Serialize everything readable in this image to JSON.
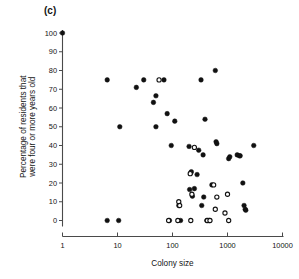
{
  "figure": {
    "panel_label": "(c)",
    "background_color": "#ffffff",
    "axis_color": "#4a4a4a",
    "marker_color": "#111111"
  },
  "chart_data": {
    "type": "scatter",
    "title": "(c)",
    "xlabel": "Colony size",
    "ylabel": "Percentage of residents that were four or more years old",
    "xscale": "log",
    "yscale": "linear",
    "xlim": [
      1,
      10000
    ],
    "ylim": [
      0,
      100
    ],
    "xticks": [
      1,
      10,
      100,
      1000,
      10000
    ],
    "xtick_labels": [
      "1",
      "10",
      "100",
      "1000",
      "10000"
    ],
    "yticks": [
      0,
      10,
      20,
      30,
      40,
      50,
      60,
      70,
      80,
      90,
      100
    ],
    "ytick_labels": [
      "0",
      "10",
      "20",
      "30",
      "40",
      "50",
      "60",
      "70",
      "80",
      "90",
      "100"
    ],
    "grid": false,
    "legend": null,
    "series": [
      {
        "name": "filled-circles",
        "marker": "filled circle",
        "marker_color": "#111111",
        "points": [
          [
            1,
            100
          ],
          [
            6.5,
            75
          ],
          [
            6.5,
            0
          ],
          [
            11,
            50
          ],
          [
            10.5,
            0
          ],
          [
            22,
            71
          ],
          [
            30,
            75
          ],
          [
            45,
            63
          ],
          [
            50,
            66.5
          ],
          [
            50,
            50
          ],
          [
            70,
            75
          ],
          [
            80,
            57
          ],
          [
            88,
            0
          ],
          [
            95,
            40
          ],
          [
            110,
            53
          ],
          [
            130,
            8
          ],
          [
            140,
            0
          ],
          [
            200,
            39.5
          ],
          [
            205,
            16.5
          ],
          [
            215,
            25.5
          ],
          [
            220,
            26
          ],
          [
            230,
            13
          ],
          [
            250,
            17
          ],
          [
            280,
            24.5
          ],
          [
            300,
            37.5
          ],
          [
            330,
            75
          ],
          [
            340,
            8
          ],
          [
            360,
            35
          ],
          [
            370,
            12.5
          ],
          [
            390,
            54
          ],
          [
            420,
            0
          ],
          [
            450,
            0
          ],
          [
            470,
            0
          ],
          [
            520,
            19
          ],
          [
            600,
            80
          ],
          [
            620,
            42
          ],
          [
            640,
            41
          ],
          [
            1050,
            33
          ],
          [
            1100,
            34
          ],
          [
            1500,
            35
          ],
          [
            1650,
            34.5
          ],
          [
            1700,
            34.5
          ],
          [
            1900,
            20
          ],
          [
            2000,
            8
          ],
          [
            2100,
            6
          ],
          [
            2150,
            5.5
          ],
          [
            3000,
            40
          ]
        ]
      },
      {
        "name": "open-circles",
        "marker": "open circle",
        "marker_color": "#ffffff",
        "points": [
          [
            57,
            75
          ],
          [
            85,
            0
          ],
          [
            125,
            0
          ],
          [
            130,
            10
          ],
          [
            135,
            8
          ],
          [
            210,
            25
          ],
          [
            215,
            0
          ],
          [
            225,
            14
          ],
          [
            250,
            39
          ],
          [
            430,
            0
          ],
          [
            480,
            0
          ],
          [
            560,
            19
          ],
          [
            600,
            6
          ],
          [
            640,
            12.5
          ],
          [
            900,
            4
          ],
          [
            1000,
            14
          ],
          [
            1050,
            0
          ]
        ]
      }
    ]
  },
  "axes": {
    "x_axis_name": "colony-size-axis",
    "y_axis_name": "percentage-axis"
  }
}
